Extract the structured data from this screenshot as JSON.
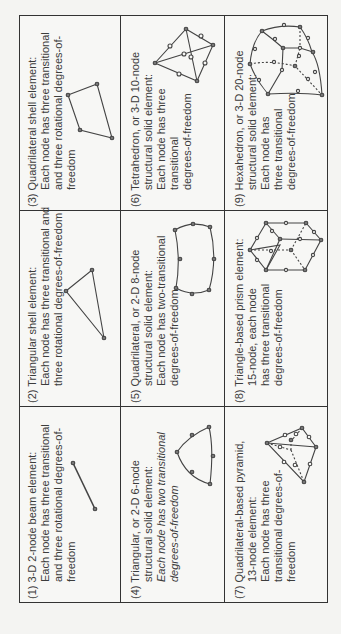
{
  "table": {
    "cells": [
      {
        "id": 1,
        "number": "(1)",
        "title": "3-D 2-node beam element:",
        "lines": [
          "Each node has three transitional",
          "and three rotational degrees-of-",
          "freedom"
        ],
        "shape": "beam"
      },
      {
        "id": 2,
        "number": "(2)",
        "title": "Triangular shell element:",
        "lines": [
          "Each node has three transitional and",
          "three rotational degrees-of-freedom"
        ],
        "shape": "triangle"
      },
      {
        "id": 3,
        "number": "(3)",
        "title": "Quadrilateral shell element:",
        "lines": [
          "Each node has three transitional",
          "and three rotational degrees-of-",
          "freedom"
        ],
        "shape": "quadrilateral"
      },
      {
        "id": 4,
        "number": "(4)",
        "title": "Triangular, or 2-D 6-node",
        "lines": [
          "structural solid element:",
          "Each node has two transitional",
          "degrees-of-freedom"
        ],
        "italic_from_line": 1,
        "shape": "triangle-6node"
      },
      {
        "id": 5,
        "number": "(5)",
        "title": "Quadrilateral, or 2-D 8-node",
        "lines": [
          "structural solid element:",
          "Each node has two-transitional",
          "degrees-of-freedom"
        ],
        "shape": "quad-8node"
      },
      {
        "id": 6,
        "number": "(6)",
        "title": "Tetrahedron, or 3-D 10-node",
        "lines": [
          "structural solid element:",
          "Each node has three",
          "transitional",
          "degrees-of-freedom"
        ],
        "shape": "tetrahedron"
      },
      {
        "id": 7,
        "number": "(7)",
        "title": "Quadrilateral-based pyramid,",
        "lines": [
          "13-node element:",
          "Each node has three",
          "transitional degrees-of-",
          "freedom"
        ],
        "shape": "pyramid"
      },
      {
        "id": 8,
        "number": "(8)",
        "title": "Triangle-based prism element:",
        "lines": [
          "15-node, each node",
          "has three transitional",
          "degrees-of-freedom"
        ],
        "shape": "prism"
      },
      {
        "id": 9,
        "number": "(9)",
        "title": "Hexahedron, or 3-D 20-node",
        "lines": [
          "structural solid element:",
          "Each node has",
          "three transitional",
          "degrees-of-freedom"
        ],
        "shape": "hexahedron"
      }
    ]
  },
  "colors": {
    "line": "#333333",
    "text": "#3c3c3c",
    "background": "#f4f4f2"
  }
}
